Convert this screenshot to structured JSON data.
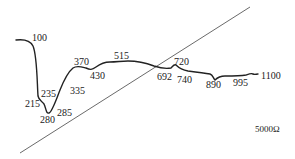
{
  "diagram": {
    "curve_color": "#222222",
    "line_color": "#444444",
    "point_labels": [
      {
        "text": "100",
        "x": 32,
        "y": 33
      },
      {
        "text": "215",
        "x": 25,
        "y": 99
      },
      {
        "text": "235",
        "x": 41,
        "y": 89
      },
      {
        "text": "280",
        "x": 40,
        "y": 115
      },
      {
        "text": "285",
        "x": 57,
        "y": 108
      },
      {
        "text": "335",
        "x": 70,
        "y": 86
      },
      {
        "text": "370",
        "x": 74,
        "y": 57
      },
      {
        "text": "430",
        "x": 90,
        "y": 71
      },
      {
        "text": "515",
        "x": 114,
        "y": 51
      },
      {
        "text": "692",
        "x": 157,
        "y": 72
      },
      {
        "text": "720",
        "x": 174,
        "y": 57
      },
      {
        "text": "740",
        "x": 177,
        "y": 75
      },
      {
        "text": "890",
        "x": 206,
        "y": 80
      },
      {
        "text": "995",
        "x": 233,
        "y": 78
      },
      {
        "text": "1100",
        "x": 261,
        "y": 71
      }
    ],
    "unit_label": {
      "text": "5000Ω",
      "x": 255,
      "y": 125
    }
  }
}
